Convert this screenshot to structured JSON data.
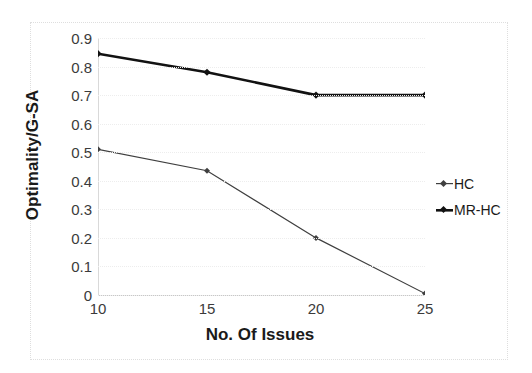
{
  "chart_data": {
    "type": "line",
    "title": "",
    "xlabel": "No. Of Issues",
    "ylabel": "Optimality/G-SA",
    "x": [
      10,
      15,
      20,
      25
    ],
    "xtick_labels": [
      "10",
      "15",
      "20",
      "25"
    ],
    "ytick_labels": [
      "0.9",
      "0.8",
      "0.7",
      "0.6",
      "0.5",
      "0.4",
      "0.3",
      "0.2",
      "0.1",
      "0"
    ],
    "ytick_values": [
      0.9,
      0.8,
      0.7,
      0.6,
      0.5,
      0.4,
      0.3,
      0.2,
      0.1,
      0
    ],
    "ylim": [
      0,
      0.9
    ],
    "xlim": [
      10,
      25
    ],
    "grid": true,
    "legend_position": "right",
    "series": [
      {
        "name": "HC",
        "values": [
          0.51,
          0.435,
          0.2,
          0.005
        ],
        "color": "#3f3f3f",
        "line_width": 1.2,
        "marker": "diamond"
      },
      {
        "name": "MR-HC",
        "values": [
          0.845,
          0.78,
          0.7,
          0.7
        ],
        "color": "#121212",
        "line_width": 2.6,
        "marker": "diamond"
      }
    ]
  },
  "legend": {
    "entries": [
      {
        "label": "HC"
      },
      {
        "label": "MR-HC"
      }
    ]
  },
  "axes": {
    "x_title": "No. Of Issues",
    "y_title": "Optimality/G-SA"
  }
}
